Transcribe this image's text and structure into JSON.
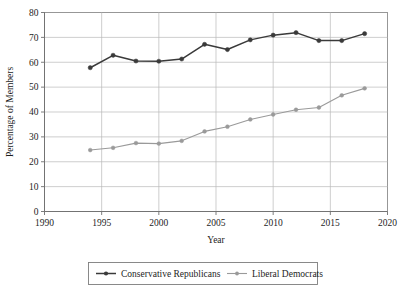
{
  "chart_data": {
    "type": "line",
    "title": "",
    "subtitle": "",
    "xlabel": "Year",
    "ylabel": "Percentage of Members",
    "xlim": [
      1990,
      2020
    ],
    "ylim": [
      0,
      80
    ],
    "grid": "horizontal-and-vertical",
    "legend_position": "bottom-outside",
    "x": [
      1994,
      1996,
      1998,
      2000,
      2002,
      2004,
      2006,
      2008,
      2010,
      2012,
      2014,
      2016,
      2018
    ],
    "xticks": [
      "1990",
      "1995",
      "2000",
      "2005",
      "2010",
      "2015",
      "2020"
    ],
    "xtick_values": [
      1990,
      1995,
      2000,
      2005,
      2010,
      2015,
      2020
    ],
    "yticks": [
      "0",
      "10",
      "20",
      "30",
      "40",
      "50",
      "60",
      "70",
      "80"
    ],
    "ytick_values": [
      0,
      10,
      20,
      30,
      40,
      50,
      60,
      70,
      80
    ],
    "series": [
      {
        "name": "Conservative Republicans",
        "color": "#3a3a3a",
        "marker": "circle",
        "values": [
          57.8,
          62.8,
          60.5,
          60.4,
          61.3,
          67.2,
          65.1,
          69.0,
          70.9,
          71.9,
          68.7,
          68.7,
          71.5
        ]
      },
      {
        "name": "Liberal Democrats",
        "color": "#9a9a9a",
        "marker": "circle",
        "values": [
          24.7,
          25.6,
          27.5,
          27.3,
          28.4,
          32.2,
          34.1,
          37.0,
          39.0,
          40.9,
          41.8,
          46.7,
          49.5
        ]
      }
    ]
  },
  "axes": {
    "y_title": "Percentage of Members",
    "x_title": "Year"
  },
  "legend": {
    "entries": [
      {
        "label": "Conservative Republicans",
        "color": "#3a3a3a"
      },
      {
        "label": "Liberal Democrats",
        "color": "#9a9a9a"
      }
    ]
  }
}
